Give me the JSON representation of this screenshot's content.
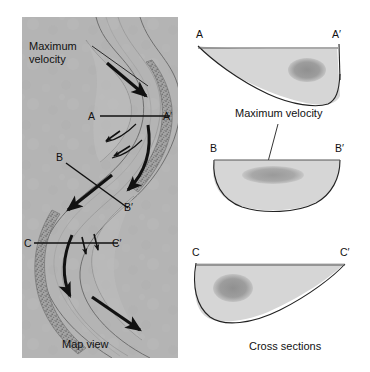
{
  "figure": {
    "map_panel": {
      "caption": "Map view",
      "annotation_label_line1": "Maximum",
      "annotation_label_line2": "velocity",
      "section_lines": [
        {
          "left_label": "A",
          "right_label": "A′",
          "orientation": "horizontal"
        },
        {
          "left_label": "B",
          "right_label": "B′",
          "orientation": "diagonal"
        },
        {
          "left_label": "C",
          "right_label": "C′",
          "orientation": "horizontal"
        }
      ]
    },
    "cross_sections_panel": {
      "caption": "Cross sections",
      "annotation_label": "Maximum velocity",
      "sections": [
        {
          "left_label": "A",
          "right_label": "A′",
          "shape": "asymmetric-deep-right"
        },
        {
          "left_label": "B",
          "right_label": "B′",
          "shape": "symmetric-u"
        },
        {
          "left_label": "C",
          "right_label": "C′",
          "shape": "asymmetric-deep-left"
        }
      ]
    },
    "colors": {
      "map_background": "#b4b4b4",
      "water_fill": "#d3d3d3",
      "velocity_core": "#9a9a9a",
      "bank_deposit": "#8f8f8f",
      "line": "#1a1a1a",
      "page_background": "#ffffff"
    }
  }
}
